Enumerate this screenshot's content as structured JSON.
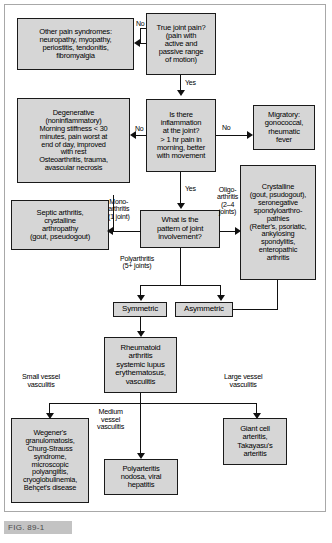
{
  "figure": {
    "caption": "FIG. 89-1"
  },
  "nodes": {
    "other_pain": "Other pain syndromes:\nneuropathy, myopathy,\nperiostitis, tendonitis,\nfibromyalgia",
    "true_joint_pain": "True joint pain?\n(pain with\nactive and\npassive range\nof motion)",
    "degenerative": "Degenerative\n(noninflammatory)\nMorning stiffness < 30\nminutes, pain worst at\nend of day, improved\nwith rest\nOsteoarthritis, trauma,\navascular necrosis",
    "inflammation": "Is there\ninflammation\nat the joint?\n> 1 hr pain in\nmorning, better\nwith movement",
    "migratory": "Migratory:\ngonococcal,\nrheumatic\nfever",
    "septic": "Septic arthritis,\ncrystalline\narthropathy\n(gout, pseudogout)",
    "pattern": "What is the\npattern of joint\ninvolvement?",
    "crystalline": "Crystalline\n(gout, psudogout),\nseronegative\nspondyloarthro-\npathies\n(Reiter's, psoriatic,\nankylosing\nspondylitis,\nenteropathic\narthritis",
    "symmetric": "Symmetric",
    "asymmetric": "Asymmetric",
    "rheumatoid": "Rheumatoid\narthritis\nsystemic lupus\nerythematosus,\nvasculitis",
    "wegeners": "Wegener's\ngranulomatosis,\nChurg-Strauss\nsyndrome,\nmicroscopic\npolyangiitis,\ncryoglobulinemia,\nBehçet's disease",
    "polyarteritis": "Polyarteritis\nnodosa, viral\nhepatitis",
    "giant_cell": "Giant cell\narteritis,\nTakayasu's\narteritis"
  },
  "edge_labels": {
    "no_true_joint_pain": "No",
    "yes_true_joint_pain": "Yes",
    "no_inflammation_left": "No",
    "no_inflammation_right": "No",
    "yes_inflammation": "Yes",
    "mono_arthritis": "Mono-\narthritis\n(1 joint)",
    "oligo_arthritis": "Oligo-\narthritis\n(2–4\njoints)",
    "polyarthritis": "Polyarthritis\n(5+ joints)",
    "small_vessel": "Small vessel\nvasculitis",
    "medium_vessel": "Medium\nvessel\nvasculitis",
    "large_vessel": "Large vessel\nvasculitis"
  },
  "colors": {
    "box_fill": "#d6d6d6",
    "box_border": "#1a1a1a",
    "line": "#111111",
    "caption_bar": "#c3c3c3",
    "caption_text": "#4a4a4a"
  }
}
